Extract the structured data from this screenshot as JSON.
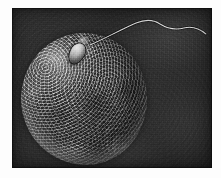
{
  "figure": {
    "kind": "scanning-electron-micrograph",
    "palette": {
      "paper": "#fdfdfd",
      "background_field": "#2e2e2e",
      "ovum_midtone": "#7b7b7b",
      "ovum_highlight": "#d7d7d7",
      "ovum_shadow": "#2f2f2f",
      "flagellum": "#e8e8e8"
    },
    "plate": {
      "left": 12,
      "top": 8,
      "width": 200,
      "height": 160
    },
    "specimens": [
      {
        "id": "ovum",
        "label": "ovum",
        "shape": "sphere",
        "center_x": 72,
        "center_y": 91,
        "radius_x": 63,
        "radius_y": 66,
        "surface": "granular crumpled zona pellucida",
        "lighting": "highlight upper-left, shadow lower-right"
      },
      {
        "id": "sperm-head",
        "label": "sperm head",
        "shape": "oval",
        "center_x": 65,
        "center_y": 45,
        "width": 14,
        "height": 21,
        "rotation_deg": 28
      },
      {
        "id": "sperm-flagellum",
        "label": "sperm tail",
        "shape": "undulating filament",
        "stroke_width": 1.1,
        "path": "M 78 37 C 92 31, 108 22, 124 15 C 134 11, 142 12, 148 16 C 156 21, 164 22, 172 20 C 180 18, 188 21, 194 26"
      }
    ],
    "annotations": [],
    "caption": ""
  }
}
